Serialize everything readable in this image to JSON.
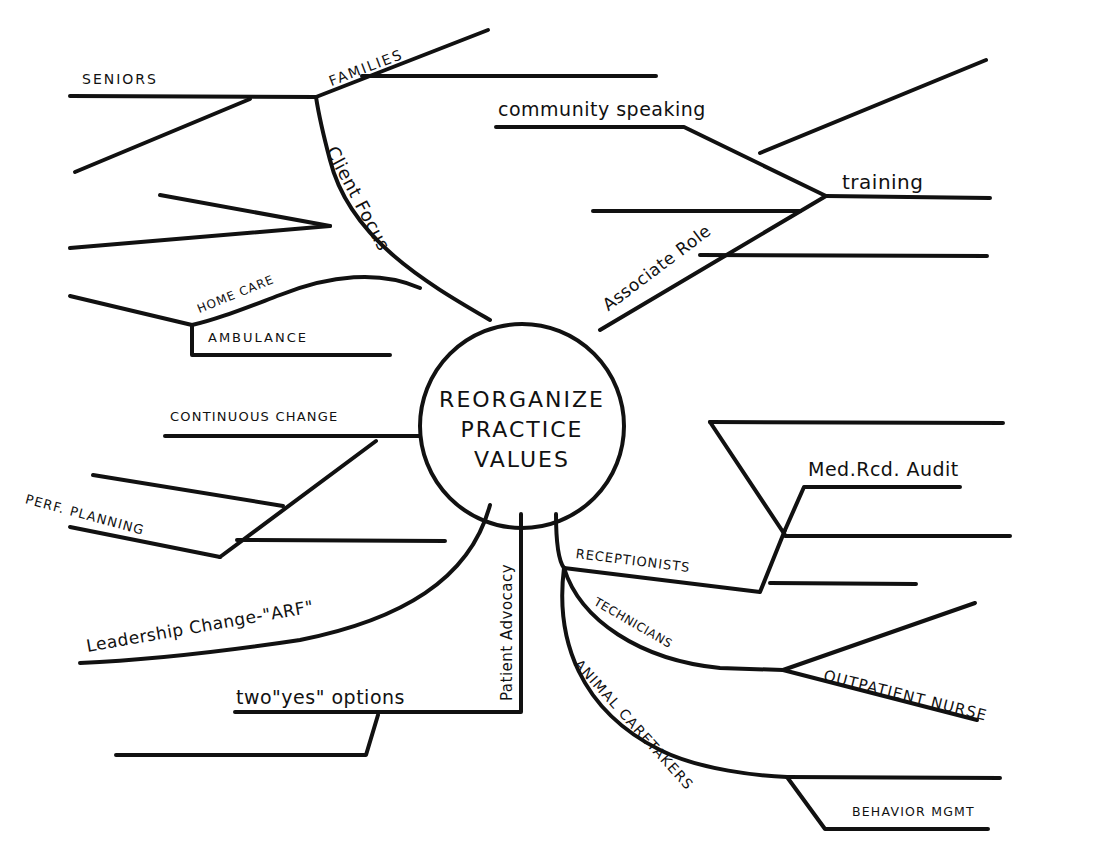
{
  "diagram": {
    "type": "mind-map",
    "center": {
      "lines": [
        "REORGANIZE",
        "PRACTICE",
        "VALUES"
      ]
    },
    "branches": [
      {
        "label": "Client Focus",
        "children": [
          {
            "label": "FAMILIES"
          },
          {
            "label": "SENIORS"
          },
          {
            "label": ""
          },
          {
            "label": "HOME CARE"
          },
          {
            "label": "AMBULANCE"
          }
        ]
      },
      {
        "label": "Associate Role",
        "children": [
          {
            "label": "training",
            "children": [
              {
                "label": "community speaking"
              }
            ]
          },
          {
            "label": ""
          },
          {
            "label": ""
          }
        ]
      },
      {
        "label": "",
        "children": [
          {
            "label": "CONTINUOUS CHANGE"
          },
          {
            "label": "PERF. PLANNING"
          }
        ]
      },
      {
        "label": "Leadership Change-\"ARF\""
      },
      {
        "label": "Patient Advocacy",
        "children": [
          {
            "label": "two \"yes\" options"
          }
        ]
      },
      {
        "label": "",
        "children": [
          {
            "label": "RECEPTIONISTS",
            "children": [
              {
                "label": "Med.Rcd. Audit"
              }
            ]
          },
          {
            "label": "TECHNICIANS",
            "children": [
              {
                "label": "OUTPATIENT NURSE"
              }
            ]
          },
          {
            "label": "ANIMAL CARETAKERS",
            "children": [
              {
                "label": "BEHAVIOR MGMT"
              }
            ]
          }
        ]
      }
    ]
  },
  "labels": {
    "center_line1": "REORGANIZE",
    "center_line2": "PRACTICE",
    "center_line3": "VALUES",
    "seniors": "SENIORS",
    "families": "FAMILIES",
    "client_focus": "Client Focus",
    "home_care": "HOME CARE",
    "ambulance": "AMBULANCE",
    "community_speaking": "community speaking",
    "training": "training",
    "associate_role": "Associate Role",
    "continuous_change": "CONTINUOUS CHANGE",
    "perf_planning": "PERF. PLANNING",
    "leadership_change": "Leadership Change-\"ARF\"",
    "two_yes_options": "two\"yes\" options",
    "patient_advocacy": "Patient Advocacy",
    "receptionists": "RECEPTIONISTS",
    "med_rcd_audit": "Med.Rcd. Audit",
    "technicians": "TECHNICIANS",
    "outpatient_nurse": "OUTPATIENT NURSE",
    "animal_caretakers": "ANIMAL CARETAKERS",
    "behavior_mgmt": "BEHAVIOR MGMT"
  }
}
